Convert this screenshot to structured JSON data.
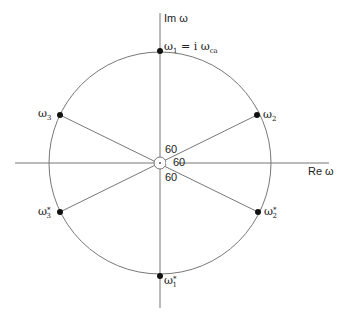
{
  "diagram": {
    "axes": {
      "imaginary_label": "Im ω",
      "real_label": "Re ω"
    },
    "points": [
      {
        "id": "w1",
        "base": "ω",
        "sub": "1",
        "suffix": " = i ω",
        "suffix_sub": "ca"
      },
      {
        "id": "w2",
        "base": "ω",
        "sub": "2"
      },
      {
        "id": "w3",
        "base": "ω",
        "sub": "3"
      },
      {
        "id": "w1c",
        "base": "ω",
        "sub": "1",
        "sup": "*"
      },
      {
        "id": "w2c",
        "base": "ω",
        "sub": "2",
        "sup": "*"
      },
      {
        "id": "w3c",
        "base": "ω",
        "sub": "3",
        "sup": "*"
      }
    ],
    "angles": [
      "60",
      "60",
      "60"
    ],
    "colors": {
      "line": "#777777",
      "dot": "#111111",
      "text": "#222222"
    }
  }
}
